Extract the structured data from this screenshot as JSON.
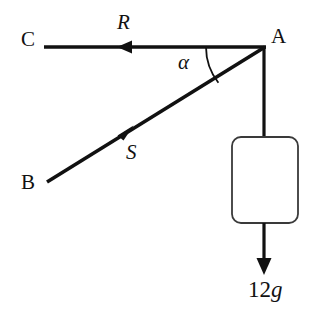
{
  "figure": {
    "background_color": "#ffffff",
    "line_color": "#111111",
    "box_stroke_color": "#3a3a3a",
    "width": 327,
    "height": 321
  },
  "labels": {
    "point_c": "C",
    "point_a": "A",
    "point_b": "B",
    "force_r": "R",
    "force_s": "S",
    "angle_alpha": "α",
    "weight_number": "12",
    "weight_symbol": "g"
  },
  "geometry": {
    "point_c": {
      "x": 46,
      "y": 47
    },
    "point_a": {
      "x": 264,
      "y": 47
    },
    "point_b": {
      "x": 47,
      "y": 182
    },
    "wall_bottom": {
      "x": 46,
      "y": 305
    },
    "box": {
      "x": 232,
      "y": 137,
      "width": 66,
      "height": 86,
      "corner_radius": 9
    },
    "weight_arrow": {
      "x": 264,
      "y_start": 223,
      "y_end": 274
    },
    "angle_arc_radius": 58,
    "arrow_r_tip": {
      "x": 118,
      "y": 47
    },
    "arrow_s_tip": {
      "x": 131,
      "y": 128
    }
  }
}
